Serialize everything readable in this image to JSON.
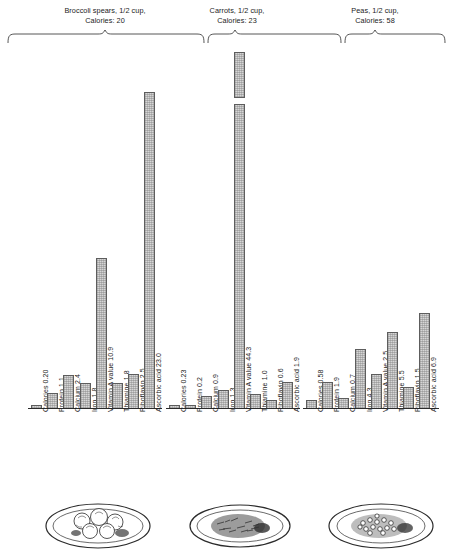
{
  "figure": {
    "axis_baseline_label": "",
    "bar_fill_color": "#d6d6d6",
    "bar_border_color": "#5d5d5d",
    "background_color": "#ffffff",
    "break_note": "Vitamin A value bar for Carrots is broken; value exceeds chart scale"
  },
  "chart_data": {
    "type": "bar",
    "title": "",
    "xlabel": "",
    "ylabel": "",
    "grid": false,
    "legend": "none",
    "categories": [
      "Calories",
      "Protein",
      "Calcium",
      "Iron",
      "Vitamin A value",
      "Thiamine",
      "Riboflavin",
      "Ascorbic acid"
    ],
    "ylim": [
      0,
      24
    ],
    "series": [
      {
        "name": "Broccoli spears, 1/2 cup",
        "calories": 20,
        "values": [
          0.2,
          1.1,
          2.4,
          1.8,
          10.9,
          1.8,
          2.5,
          23.0
        ],
        "value_labels": [
          "0.20",
          "1.1",
          "2.4",
          "1.8",
          "10.9",
          "1.8",
          "2.5",
          "23.0"
        ],
        "broken_bar_index": null
      },
      {
        "name": "Carrots, 1/2 cup",
        "calories": 23,
        "values": [
          0.23,
          0.2,
          0.9,
          1.3,
          44.3,
          1.0,
          0.6,
          1.9
        ],
        "value_labels": [
          "0.23",
          "0.2",
          "0.9",
          "1.3",
          "44.3",
          "1.0",
          "0.6",
          "1.9"
        ],
        "broken_bar_index": 4
      },
      {
        "name": "Peas, 1/2 cup",
        "calories": 58,
        "values": [
          0.58,
          1.9,
          0.7,
          4.3,
          2.5,
          5.5,
          1.5,
          6.9
        ],
        "value_labels": [
          "0.58",
          "1.9",
          "0.7",
          "4.3",
          "2.5",
          "5.5",
          "1.5",
          "6.9"
        ],
        "broken_bar_index": null
      }
    ]
  },
  "groups": [
    {
      "header_line1": "Broccoli spears, 1/2 cup,",
      "header_line2": "Calories: 20",
      "plate_caption": "plate of broccoli spears"
    },
    {
      "header_line1": "Carrots, 1/2 cup,",
      "header_line2": "Calories: 23",
      "plate_caption": "plate of shredded carrots"
    },
    {
      "header_line1": "Peas, 1/2 cup,",
      "header_line2": "Calories: 58",
      "plate_caption": "plate of peas"
    }
  ]
}
